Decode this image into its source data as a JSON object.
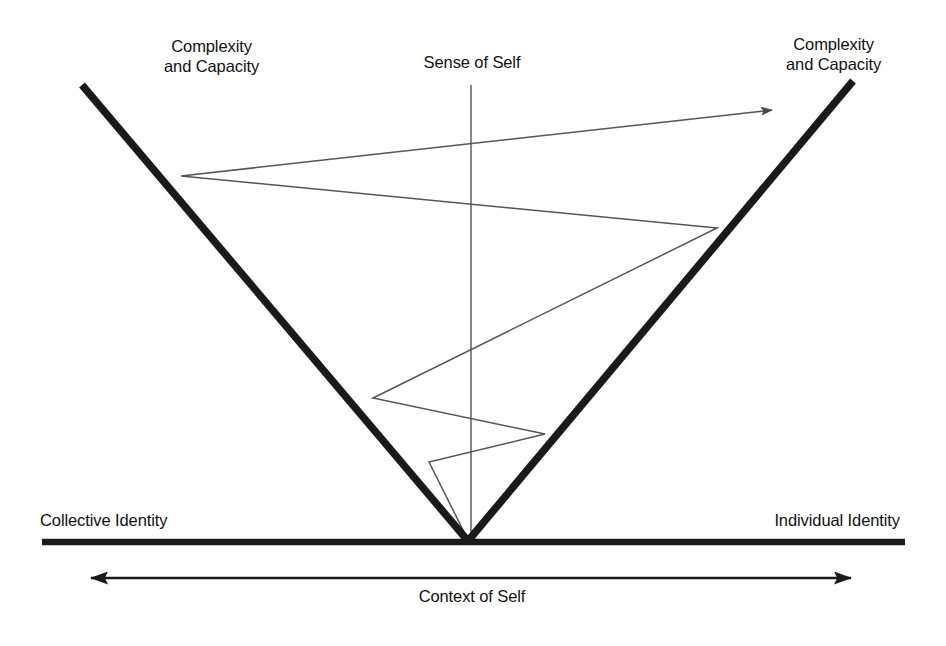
{
  "diagram": {
    "labels": {
      "complexity_left": "Complexity\nand Capacity",
      "complexity_right": "Complexity\nand Capacity",
      "sense_of_self": "Sense of Self",
      "collective_identity": "Collective Identity",
      "individual_identity": "Individual Identity",
      "context_of_self": "Context of Self"
    },
    "colors": {
      "ink": "#111111",
      "heavy_line": "#1a1a1a",
      "thin_line": "#555555",
      "background": "#ffffff"
    },
    "geometry": {
      "vertex": [
        468,
        540
      ],
      "v_left_top": [
        82,
        85
      ],
      "v_right_top": [
        853,
        81
      ],
      "baseline": {
        "x1": 42,
        "x2": 905,
        "y": 542
      },
      "axis_arrow": {
        "x1": 87,
        "x2": 855,
        "y": 578
      },
      "sense_axis": {
        "x": 471,
        "y1": 85,
        "y2": 540
      },
      "spiral_points": [
        [
          468,
          540
        ],
        [
          429,
          462
        ],
        [
          545,
          434
        ],
        [
          373,
          398
        ],
        [
          717,
          228
        ],
        [
          181,
          176
        ],
        [
          775,
          110
        ]
      ]
    }
  }
}
